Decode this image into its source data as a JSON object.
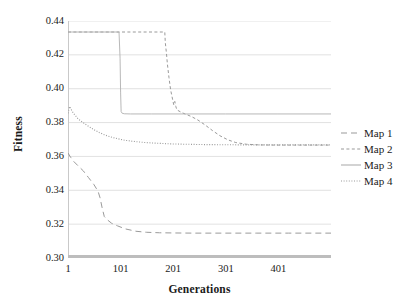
{
  "chart_data": {
    "type": "line",
    "title": "",
    "xlabel": "Generations",
    "ylabel": "Fitness",
    "xlim": [
      1,
      501
    ],
    "ylim": [
      0.3,
      0.44
    ],
    "xticks": [
      1,
      101,
      201,
      301,
      401
    ],
    "yticks": [
      "0.30",
      "0.32",
      "0.34",
      "0.36",
      "0.38",
      "0.40",
      "0.42",
      "0.44"
    ],
    "grid": "horizontal",
    "legend_position": "right",
    "series": [
      {
        "name": "Map 1",
        "style": "long-dash",
        "color": "#9a9a9a",
        "x": [
          1,
          6,
          12,
          20,
          30,
          40,
          50,
          58,
          62,
          66,
          70,
          76,
          84,
          95,
          110,
          130,
          150,
          175,
          200,
          240,
          300,
          360,
          420,
          470,
          501
        ],
        "y": [
          0.362,
          0.3595,
          0.357,
          0.3545,
          0.3515,
          0.3475,
          0.3435,
          0.3395,
          0.3355,
          0.3295,
          0.3245,
          0.3225,
          0.3205,
          0.319,
          0.3172,
          0.3158,
          0.3152,
          0.3149,
          0.3148,
          0.3147,
          0.3147,
          0.3147,
          0.3147,
          0.3147,
          0.3147
        ]
      },
      {
        "name": "Map 2",
        "style": "short-dash",
        "color": "#9a9a9a",
        "x": [
          1,
          185,
          186,
          188,
          190,
          193,
          196,
          198,
          200,
          202,
          204,
          206,
          208,
          212,
          218,
          226,
          236,
          248,
          262,
          276,
          290,
          305,
          320,
          340,
          365,
          395,
          430,
          470,
          501
        ],
        "y": [
          0.4335,
          0.4335,
          0.4272,
          0.4215,
          0.4145,
          0.4065,
          0.3995,
          0.3965,
          0.3935,
          0.3905,
          0.3925,
          0.3895,
          0.3875,
          0.3868,
          0.3858,
          0.3848,
          0.3835,
          0.3815,
          0.3785,
          0.3752,
          0.3722,
          0.3698,
          0.3682,
          0.3672,
          0.3668,
          0.3667,
          0.3667,
          0.3667,
          0.3667
        ]
      },
      {
        "name": "Map 3",
        "style": "solid",
        "color": "#b0b0b0",
        "x": [
          1,
          98,
          100,
          101,
          102,
          104,
          108,
          120,
          160,
          220,
          300,
          400,
          501
        ],
        "y": [
          0.4335,
          0.4335,
          0.418,
          0.398,
          0.3865,
          0.3855,
          0.3852,
          0.3851,
          0.3851,
          0.3851,
          0.3851,
          0.3851,
          0.3851
        ]
      },
      {
        "name": "Map 4",
        "style": "dotted",
        "color": "#9a9a9a",
        "x": [
          1,
          4,
          8,
          12,
          16,
          20,
          26,
          32,
          38,
          45,
          52,
          60,
          70,
          82,
          95,
          110,
          128,
          148,
          170,
          195,
          225,
          260,
          300,
          345,
          395,
          445,
          501
        ],
        "y": [
          0.3855,
          0.3895,
          0.3872,
          0.3852,
          0.3838,
          0.3822,
          0.3808,
          0.3795,
          0.3782,
          0.3768,
          0.3755,
          0.3742,
          0.3728,
          0.3715,
          0.3705,
          0.3695,
          0.3688,
          0.3682,
          0.3678,
          0.3674,
          0.3672,
          0.367,
          0.3669,
          0.3668,
          0.3668,
          0.3668,
          0.3668
        ]
      },
      {
        "name": "baseline",
        "style": "thick-solid",
        "color": "#bdbdbd",
        "x": [
          1,
          501
        ],
        "y": [
          0.3005,
          0.3005
        ]
      }
    ]
  },
  "legend": {
    "items": [
      {
        "label": "Map 1"
      },
      {
        "label": "Map 2"
      },
      {
        "label": "Map 3"
      },
      {
        "label": "Map 4"
      }
    ]
  },
  "colors": {
    "grid": "#d9d9d9",
    "axis": "#c9c9c9",
    "text": "#1a1a1a",
    "series": "#9a9a9a"
  }
}
